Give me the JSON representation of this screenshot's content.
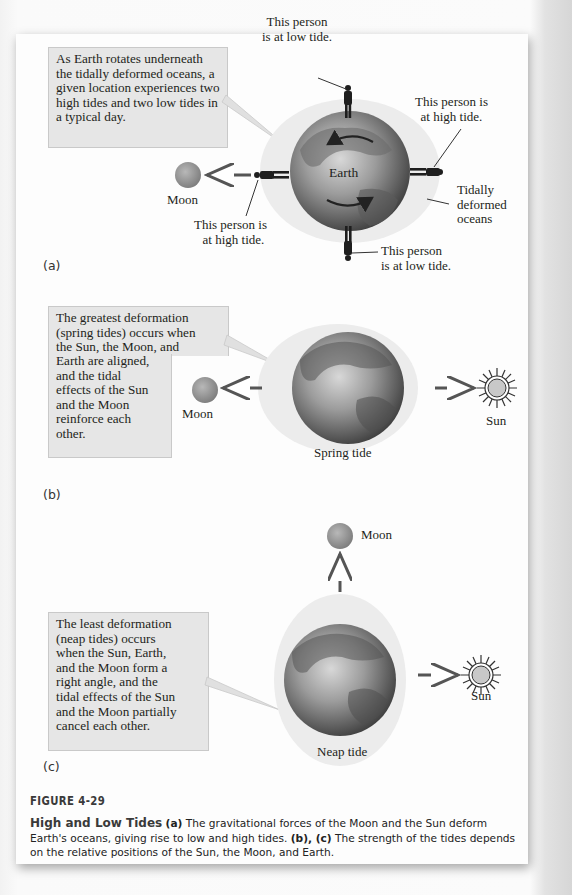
{
  "figure": {
    "number": "FIGURE 4-29",
    "caption": {
      "title": "High and Low Tides",
      "part_a_marker": "(a)",
      "part_a_text": "The gravitational forces of the Moon and the Sun deform Earth's oceans, giving rise to low and high tides.",
      "part_bc_marker": "(b), (c)",
      "part_bc_text": "The strength of the tides depends on the relative positions of the Sun, the Moon, and Earth."
    }
  },
  "panel_a": {
    "letter": "(a)",
    "callout": "As Earth rotates underneath the tidally deformed oceans, a given location experiences two high tides and two low tides in a typical day.",
    "earth_label": "Earth",
    "moon_label": "Moon",
    "person_top": [
      "This person",
      "is at low tide."
    ],
    "person_right": [
      "This person is",
      "at high tide."
    ],
    "person_left": [
      "This person is",
      "at high tide."
    ],
    "person_bottom": [
      "This person",
      "is at low tide."
    ],
    "oceans_label": [
      "Tidally",
      "deformed",
      "oceans"
    ]
  },
  "panel_b": {
    "letter": "(b)",
    "callout": "The greatest deformation (spring tides) occurs when the Sun, the Moon, and Earth are aligned, and the tidal effects of the Sun and the Moon reinforce each other.",
    "callout_lines_wide": [
      "The greatest deformation",
      "(spring tides) occurs when",
      "the Sun, the Moon, and"
    ],
    "callout_lines_narrow": [
      "Earth are aligned,",
      "and the tidal",
      "effects of the Sun",
      "and the Moon",
      "reinforce each",
      "other."
    ],
    "moon_label": "Moon",
    "sun_label": "Sun",
    "caption": "Spring tide"
  },
  "panel_c": {
    "letter": "(c)",
    "callout": "The least deformation (neap tides) occurs when the Sun, Earth, and the Moon form a right angle, and the tidal effects of the Sun and the Moon partially cancel each other.",
    "callout_lines": [
      "The least deformation",
      "(neap tides) occurs",
      "when the Sun, Earth,",
      "and the Moon form a",
      "right angle, and the",
      "tidal effects of the Sun",
      "and the Moon partially",
      "cancel each other."
    ],
    "moon_label": "Moon",
    "sun_label": "Sun",
    "caption": "Neap tide"
  },
  "colors": {
    "callout_bg": "#e6e6e6",
    "ocean_bulge": "#ececec",
    "earth_dark": "#555555",
    "earth_light": "#cfcfcf",
    "moon": "#9a9a9a",
    "text": "#231f20"
  }
}
